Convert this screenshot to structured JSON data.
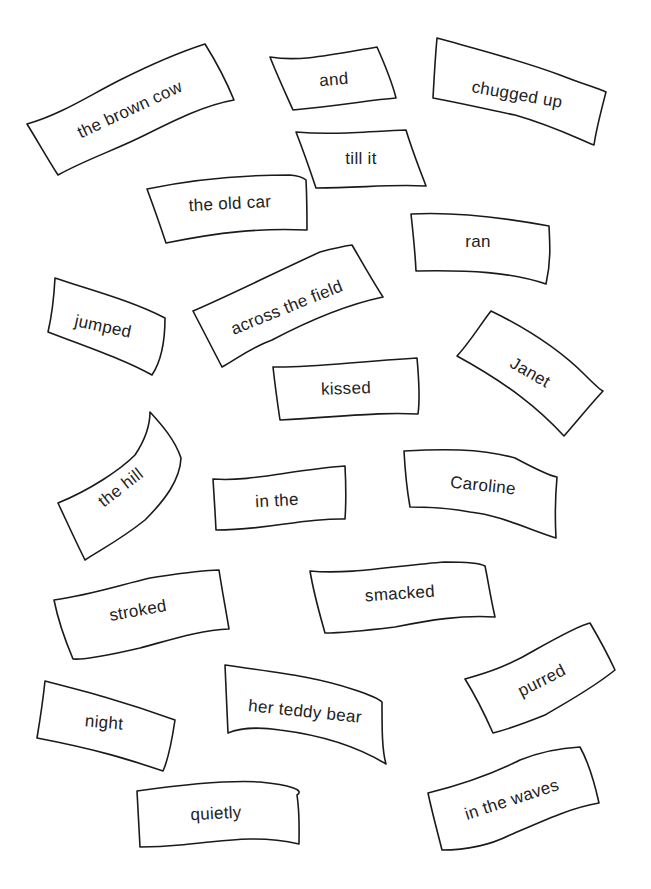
{
  "worksheet": {
    "background": "#ffffff",
    "line_color": "#1a1a1a",
    "text_color": "#222222",
    "cards": [
      {
        "label": "the brown cow",
        "path": "M27,124 C60,115 90,95 120,80 C150,65 180,52 205,44 C215,60 225,78 234,100 C205,105 175,120 145,135 C115,150 85,160 58,175 C47,158 37,140 27,124 Z",
        "tx": 130,
        "ty": 110,
        "rot": -25
      },
      {
        "label": "and",
        "path": "M270,57 C300,62 330,55 377,47 C385,65 392,82 396,98 C370,100 345,105 293,110 C285,92 277,75 270,57 Z",
        "tx": 334,
        "ty": 80,
        "rot": -5
      },
      {
        "label": "chugged up",
        "path": "M437,38 C480,50 520,60 560,75 C580,83 597,88 606,92 C600,115 596,130 594,145 C570,135 550,125 515,115 C490,110 470,105 433,98 C434,80 435,60 437,38 Z",
        "tx": 517,
        "ty": 95,
        "rot": 10
      },
      {
        "label": "till it",
        "path": "M296,132 C330,135 360,132 406,130 C412,150 418,165 426,186 C390,184 360,188 316,188 C310,170 303,150 296,132 Z",
        "tx": 361,
        "ty": 159,
        "rot": 0
      },
      {
        "label": "the old car",
        "path": "M147,189 C190,180 240,175 290,175 C300,176 304,178 306,180 C307,200 307,218 307,230 C260,228 220,232 166,243 C160,225 153,205 147,189 Z",
        "tx": 230,
        "ty": 204,
        "rot": -3
      },
      {
        "label": "ran",
        "path": "M411,214 C450,212 490,215 549,226 C550,245 551,262 546,284 C510,272 470,270 416,271 C415,250 413,232 411,214 Z",
        "tx": 478,
        "ty": 242,
        "rot": 0
      },
      {
        "label": "jumped",
        "path": "M55,278 C90,290 130,300 165,318 C165,340 162,360 152,375 C125,360 95,350 48,332 C52,315 54,297 55,278 Z",
        "tx": 103,
        "ty": 327,
        "rot": 12
      },
      {
        "label": "across the field",
        "path": "M193,311 C230,295 270,275 320,252 C335,248 345,246 352,245 C362,262 372,280 383,297 C345,305 310,320 272,340 C250,348 235,360 222,367 C212,348 203,330 193,311 Z",
        "tx": 287,
        "ty": 308,
        "rot": -22
      },
      {
        "label": "Janet",
        "path": "M457,356 C470,342 480,325 491,311 C530,330 560,350 585,375 C595,385 600,390 603,391 C590,405 578,420 564,436 C540,410 510,385 457,356 Z",
        "tx": 530,
        "ty": 373,
        "rot": 30
      },
      {
        "label": "kissed",
        "path": "M273,367 C310,368 350,362 417,358 C419,380 420,400 418,414 C380,412 350,416 280,420 C277,400 275,385 273,367 Z",
        "tx": 346,
        "ty": 389,
        "rot": -2
      },
      {
        "label": "the hill",
        "path": "M58,503 C90,490 120,470 135,455 C145,440 150,425 150,412 C162,425 175,440 181,458 C180,480 165,500 145,520 C120,540 100,550 85,560 C75,540 66,520 58,503 Z",
        "tx": 121,
        "ty": 488,
        "rot": -38
      },
      {
        "label": "in the",
        "path": "M213,479 C250,482 290,470 345,466 C346,485 346,505 345,519 C300,518 270,530 216,530 C215,510 214,495 213,479 Z",
        "tx": 277,
        "ty": 501,
        "rot": -3
      },
      {
        "label": "Caroline",
        "path": "M404,451 C440,449 480,448 515,458 C530,466 550,476 557,477 C555,500 555,520 556,538 C530,530 500,515 470,512 C450,508 430,507 410,507 C407,490 405,470 404,451 Z",
        "tx": 483,
        "ty": 486,
        "rot": 6
      },
      {
        "label": "stroked",
        "path": "M54,600 C90,595 120,585 150,578 C170,575 200,570 219,570 C222,590 225,605 229,629 C200,630 170,640 140,648 C110,655 85,660 73,659 C65,640 58,620 54,600 Z",
        "tx": 138,
        "ty": 611,
        "rot": -10
      },
      {
        "label": "smacked",
        "path": "M310,571 C350,575 400,565 445,562 C465,562 480,563 485,566 C488,580 490,595 495,617 C460,615 430,620 395,627 C370,630 340,633 325,633 C320,615 314,595 310,571 Z",
        "tx": 400,
        "ty": 594,
        "rot": -4
      },
      {
        "label": "night",
        "path": "M45,681 C80,690 120,700 175,720 C172,740 168,760 163,771 C130,760 100,750 37,738 C40,720 43,700 45,681 Z",
        "tx": 104,
        "ty": 723,
        "rot": 5
      },
      {
        "label": "her teddy bear",
        "path": "M225,665 C270,672 310,675 355,690 C370,695 378,698 382,702 C382,730 382,750 386,764 C355,745 320,735 280,730 C260,727 240,728 228,733 C227,710 226,690 225,665 Z",
        "tx": 305,
        "ty": 712,
        "rot": 6
      },
      {
        "label": "purred",
        "path": "M465,679 C490,672 510,665 535,650 C560,636 580,625 590,623 C600,640 608,655 615,670 C590,690 570,700 545,715 C520,725 505,730 493,733 C485,715 475,695 465,679 Z",
        "tx": 542,
        "ty": 681,
        "rot": -27
      },
      {
        "label": "quietly",
        "path": "M137,791 C180,785 230,780 260,782 C290,785 305,790 297,795 C300,815 299,832 299,844 C260,835 230,840 180,845 C160,847 150,847 140,847 C139,828 138,810 137,791 Z",
        "tx": 216,
        "ty": 814,
        "rot": -3
      },
      {
        "label": "in the waves",
        "path": "M428,793 C460,785 490,775 520,760 C540,752 560,748 580,747 C590,765 595,785 599,803 C570,808 545,820 510,835 C490,845 470,850 442,850 C437,830 432,812 428,793 Z",
        "tx": 512,
        "ty": 800,
        "rot": -18
      }
    ]
  }
}
